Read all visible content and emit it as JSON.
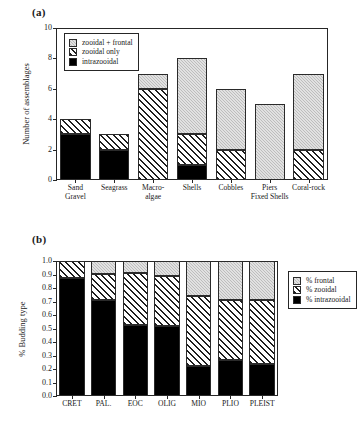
{
  "figure": {
    "panel_a_label": "(a)",
    "panel_b_label": "(b)"
  },
  "chart_data": [
    {
      "id": "a",
      "type": "bar",
      "stacked": true,
      "title": "",
      "xlabel": "",
      "ylabel": "Number of assemblages",
      "ylim": [
        0,
        10
      ],
      "yticks": [
        0,
        2,
        4,
        6,
        8,
        10
      ],
      "ytick_labels": [
        "0",
        "2",
        "4",
        "6",
        "8",
        "10"
      ],
      "grid": false,
      "legend_position": "upper-left-inside",
      "categories": [
        "Sand\nGravel",
        "Seagrass",
        "Macro-\nalgae",
        "Shells",
        "Cobbles",
        "Piers\nFixed Shells",
        "Coral-rock"
      ],
      "series": [
        {
          "name": "intrazooidal",
          "values": [
            3,
            2,
            0,
            1,
            0,
            0,
            0
          ],
          "fill": "solid",
          "color": "#000000"
        },
        {
          "name": "zooidal only",
          "values": [
            1,
            1,
            6,
            2,
            2,
            0,
            2
          ],
          "fill": "hatch",
          "color": "#ffffff"
        },
        {
          "name": "zooidal + frontal",
          "values": [
            0,
            0,
            1,
            5,
            4,
            5,
            5
          ],
          "fill": "gray",
          "color": "#bdbdbd"
        }
      ],
      "totals": [
        4,
        3,
        7,
        8,
        6,
        5,
        7
      ],
      "legend": [
        {
          "label": "zooidal + frontal",
          "fill": "gray"
        },
        {
          "label": "zooidal only",
          "fill": "hatch"
        },
        {
          "label": "intrazooidal",
          "fill": "solid"
        }
      ]
    },
    {
      "id": "b",
      "type": "bar",
      "stacked": true,
      "title": "",
      "xlabel": "",
      "ylabel": "% Budding type",
      "ylim": [
        0,
        1
      ],
      "yticks": [
        0.0,
        0.1,
        0.2,
        0.3,
        0.4,
        0.5,
        0.6,
        0.7,
        0.8,
        0.9,
        1.0
      ],
      "ytick_labels": [
        "0.0",
        "0.1",
        "0.2",
        "0.3",
        "0.4",
        "0.5",
        "0.6",
        "0.7",
        "0.8",
        "0.9",
        "1.0"
      ],
      "grid": false,
      "legend_position": "right-outside",
      "categories": [
        "CRET",
        "PAL.",
        "EOC",
        "OLIG",
        "MIO",
        "PLIO",
        "PLEIST"
      ],
      "series": [
        {
          "name": "% intrazooidal",
          "values": [
            0.875,
            0.71,
            0.525,
            0.52,
            0.22,
            0.27,
            0.235
          ],
          "fill": "solid",
          "color": "#000000"
        },
        {
          "name": "% zooidal",
          "values": [
            0.125,
            0.195,
            0.385,
            0.37,
            0.52,
            0.44,
            0.475
          ],
          "fill": "hatch",
          "color": "#ffffff"
        },
        {
          "name": "% frontal",
          "values": [
            0.0,
            0.095,
            0.09,
            0.11,
            0.26,
            0.29,
            0.29
          ],
          "fill": "gray",
          "color": "#bdbdbd"
        }
      ],
      "cumulative_tops": {
        "intrazooidal": [
          0.875,
          0.71,
          0.525,
          0.52,
          0.22,
          0.27,
          0.235
        ],
        "zooidal": [
          1.0,
          0.905,
          0.91,
          0.89,
          0.74,
          0.71,
          0.71
        ]
      },
      "legend": [
        {
          "label": "% frontal",
          "fill": "gray"
        },
        {
          "label": "% zooidal",
          "fill": "hatch"
        },
        {
          "label": "% intrazooidal",
          "fill": "solid"
        }
      ]
    }
  ]
}
